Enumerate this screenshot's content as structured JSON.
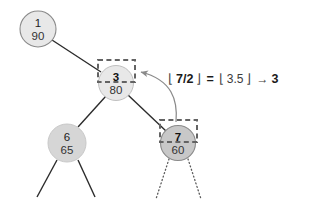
{
  "diagram": {
    "nodes": [
      {
        "id": "n1",
        "key": "1",
        "value": "90",
        "cx": 38,
        "cy": 29,
        "r": 18,
        "fill": "#e8e8e8",
        "stroke": "#7b7b7b",
        "highlighted": false,
        "boxed": false
      },
      {
        "id": "n3",
        "key": "3",
        "value": "80",
        "cx": 116,
        "cy": 83,
        "r": 17.5,
        "fill": "#e8e8e8",
        "stroke": "#b5b5b5",
        "highlighted": false,
        "boxed": true
      },
      {
        "id": "n6",
        "key": "6",
        "value": "65",
        "cx": 67,
        "cy": 143,
        "r": 19,
        "fill": "#d6d6d6",
        "stroke": "#c2c2c2",
        "highlighted": false,
        "boxed": false
      },
      {
        "id": "n7",
        "key": "7",
        "value": "60",
        "cx": 178,
        "cy": 143,
        "r": 17.5,
        "fill": "#c8c8c8",
        "stroke": "#7b7b7b",
        "highlighted": true,
        "boxed": true
      }
    ],
    "edges": [
      {
        "id": "e-1-3",
        "from": "n1",
        "to": "n3",
        "style": "solid"
      },
      {
        "id": "e-3-6",
        "from": "n3",
        "to": "n6",
        "style": "solid"
      },
      {
        "id": "e-3-7",
        "from": "n3",
        "to": "n7",
        "style": "solid"
      },
      {
        "id": "e-6-left",
        "from": "n6",
        "to": "leaf",
        "style": "solid"
      },
      {
        "id": "e-6-right",
        "from": "n6",
        "to": "leaf",
        "style": "solid"
      },
      {
        "id": "e-7-left",
        "from": "n7",
        "to": "leaf",
        "style": "dotted"
      },
      {
        "id": "e-7-right",
        "from": "n7",
        "to": "leaf",
        "style": "dotted"
      }
    ],
    "parent_arrow": {
      "id": "parent-pointer",
      "from_node": "n7",
      "to_node": "n3",
      "label": "parent-pointer-arrow"
    },
    "formula": {
      "full_text": "⌊7/2⌋ = ⌊3.5⌋ → 3",
      "tokens": [
        {
          "kind": "floor-open",
          "text": "⌊"
        },
        {
          "kind": "operand",
          "text": "7/2"
        },
        {
          "kind": "floor-close",
          "text": "⌋"
        },
        {
          "kind": "equals",
          "text": "="
        },
        {
          "kind": "floor-open",
          "text": "⌊"
        },
        {
          "kind": "operand",
          "text": "3.5"
        },
        {
          "kind": "floor-close",
          "text": "⌋"
        },
        {
          "kind": "arrow",
          "text": "→"
        },
        {
          "kind": "result",
          "text": "3"
        }
      ]
    },
    "colors": {
      "background": "#ffffff",
      "node_fill_light": "#e8e8e8",
      "node_fill_mid": "#d6d6d6",
      "node_fill_dark": "#c8c8c8",
      "edge": "#2b2b2b",
      "dashed_box": "#636363",
      "arrow": "#8a8a8a",
      "text": "#222222"
    }
  }
}
